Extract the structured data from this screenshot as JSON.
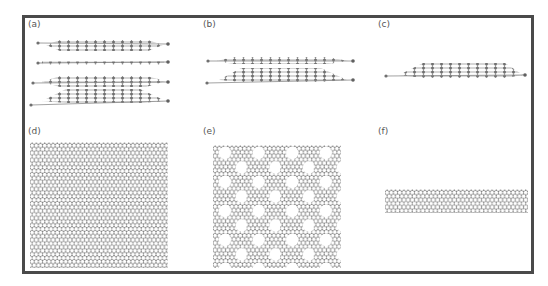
{
  "figure": {
    "panels": [
      {
        "id": "a",
        "label": "(a)",
        "description": "side view, four stacked layers"
      },
      {
        "id": "b",
        "label": "(b)",
        "description": "side view, two stacked layers"
      },
      {
        "id": "c",
        "label": "(c)",
        "description": "side view, single layer"
      },
      {
        "id": "d",
        "label": "(d)",
        "description": "top view, pristine hexagonal lattice"
      },
      {
        "id": "e",
        "label": "(e)",
        "description": "top view, porous hexagonal lattice"
      },
      {
        "id": "f",
        "label": "(f)",
        "description": "top view, nanoribbon strip"
      }
    ],
    "colors": {
      "border": "#4a4a4a",
      "atom": "#7a7a7a",
      "bond": "#9a9a9a",
      "label": "#555555"
    }
  }
}
